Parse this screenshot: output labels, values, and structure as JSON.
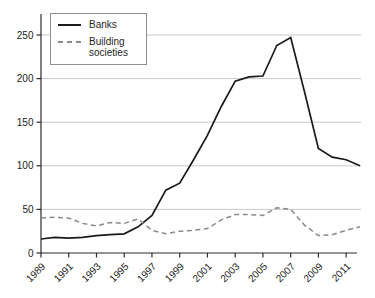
{
  "chart_data": {
    "type": "line",
    "title": "",
    "xlabel": "",
    "ylabel": "",
    "x": [
      1989,
      1990,
      1991,
      1992,
      1993,
      1994,
      1995,
      1996,
      1997,
      1998,
      1999,
      2000,
      2001,
      2002,
      2003,
      2004,
      2005,
      2006,
      2007,
      2008,
      2009,
      2010,
      2011,
      2012
    ],
    "series": [
      {
        "name": "Banks",
        "style": "solid",
        "color": "#1a1a1a",
        "values": [
          16,
          18,
          17,
          18,
          20,
          21,
          22,
          30,
          43,
          72,
          80,
          107,
          135,
          168,
          197,
          202,
          203,
          238,
          247,
          185,
          120,
          110,
          107,
          100
        ]
      },
      {
        "name": "Building societies",
        "style": "dashed",
        "color": "#8a8a8a",
        "values": [
          40,
          41,
          40,
          34,
          31,
          35,
          34,
          39,
          26,
          22,
          25,
          26,
          28,
          38,
          44,
          44,
          43,
          52,
          50,
          32,
          20,
          21,
          26,
          30
        ]
      }
    ],
    "xticks": [
      1989,
      1991,
      1993,
      1995,
      1997,
      1999,
      2001,
      2003,
      2005,
      2007,
      2009,
      2011
    ],
    "yticks": [
      0,
      50,
      100,
      150,
      200,
      250
    ],
    "ylim": [
      0,
      265
    ],
    "xlim": [
      1989,
      2012
    ],
    "grid": "horizontal",
    "grid_color": "#c9c9c9",
    "axis_color": "#2b2b2b",
    "tick_label_color": "#222222",
    "legend_position": "top-left"
  }
}
